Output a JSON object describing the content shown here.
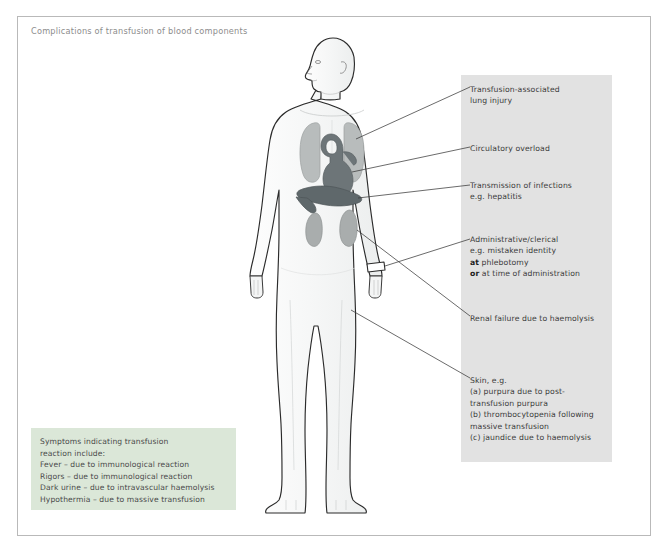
{
  "title": "Complications of transfusion of blood components",
  "colors": {
    "page_background": "#ffffff",
    "frame_border": "#b9b9b9",
    "annotation_panel": "#e2e2e2",
    "legend_panel": "#dbe7d8",
    "body_fill": "#f7f8f8",
    "body_outline": "#2b2b2b",
    "lung_fill": "#b8bcbc",
    "heart_fill": "#6d7578",
    "liver_fill": "#5f686b",
    "kidney_fill": "#a9adad",
    "leader_line": "#3a3a3a",
    "text": "#3b3b3b",
    "title_text": "#8d8d8d"
  },
  "annotations": [
    {
      "id": "trali",
      "name": "transfusion-associated-lung-injury",
      "lines": [
        "Transfusion-associated",
        "lung injury"
      ],
      "target_organ": "lungs"
    },
    {
      "id": "circulatory_overload",
      "name": "circulatory-overload",
      "lines": [
        "Circulatory overload"
      ],
      "target_organ": "heart"
    },
    {
      "id": "infections",
      "name": "transmission-of-infections",
      "lines": [
        "Transmission of infections",
        "e.g. hepatitis"
      ],
      "target_organ": "liver"
    },
    {
      "id": "administrative",
      "name": "administrative-clerical-error",
      "lines": [
        "Administrative/clerical",
        "e.g. mistaken identity",
        "at phlebotomy",
        "or at time of administration"
      ],
      "bold_words": [
        "at",
        "or"
      ],
      "target_organ": "wristband"
    },
    {
      "id": "renal_failure",
      "name": "renal-failure-due-to-haemolysis",
      "lines": [
        "Renal failure due to haemolysis"
      ],
      "target_organ": "kidneys"
    },
    {
      "id": "skin",
      "name": "skin-complications",
      "lines": [
        "Skin, e.g.",
        "(a) purpura due to post-",
        "transfusion purpura",
        "(b) thrombocytopenia following",
        "massive transfusion",
        "(c) jaundice due to haemolysis"
      ],
      "target_organ": "leg-skin"
    }
  ],
  "legend": {
    "heading_lines": [
      "Symptoms indicating transfusion",
      "reaction include:"
    ],
    "items": [
      "Fever – due to immunological reaction",
      "Rigors – due to immunological reaction",
      "Dark urine – due to intravascular haemolysis",
      "Hypothermia – due to massive transfusion"
    ]
  },
  "figure": {
    "name": "anatomical-body-diagram",
    "organs": [
      {
        "name": "lungs",
        "label": "lungs"
      },
      {
        "name": "heart",
        "label": "heart"
      },
      {
        "name": "liver",
        "label": "liver"
      },
      {
        "name": "kidneys",
        "label": "kidneys"
      },
      {
        "name": "wristband",
        "label": "identification wristband"
      }
    ]
  }
}
